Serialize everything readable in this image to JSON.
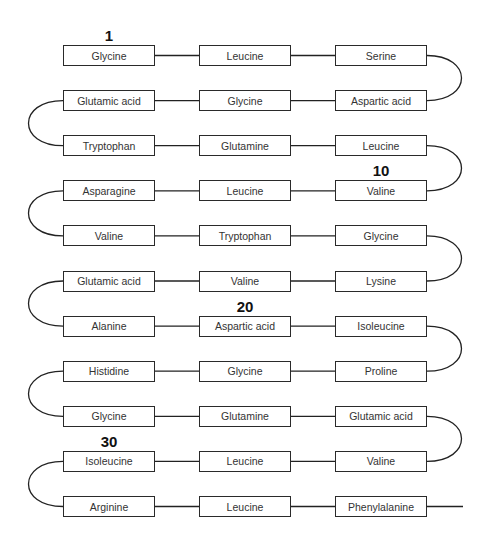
{
  "diagram": {
    "type": "polypeptide-chain",
    "residues": [
      "Glycine",
      "Leucine",
      "Serine",
      "Aspartic acid",
      "Glycine",
      "Glutamic acid",
      "Tryptophan",
      "Glutamine",
      "Leucine",
      "Valine",
      "Leucine",
      "Asparagine",
      "Valine",
      "Tryptophan",
      "Glycine",
      "Lysine",
      "Valine",
      "Glutamic acid",
      "Alanine",
      "Aspartic acid",
      "Isoleucine",
      "Proline",
      "Glycine",
      "Histidine",
      "Glycine",
      "Glutamine",
      "Glutamic acid",
      "Valine",
      "Leucine",
      "Isoleucine",
      "Arginine",
      "Leucine",
      "Phenylalanine"
    ],
    "number_labels": [
      {
        "label": "1",
        "residue_index": 1
      },
      {
        "label": "10",
        "residue_index": 10
      },
      {
        "label": "20",
        "residue_index": 20
      },
      {
        "label": "30",
        "residue_index": 30
      }
    ]
  }
}
